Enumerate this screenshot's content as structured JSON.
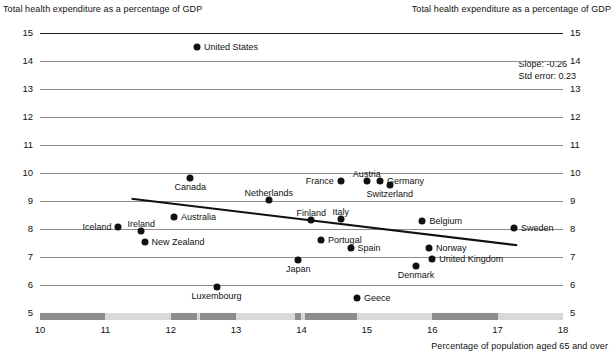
{
  "chart_data": {
    "type": "scatter",
    "title": "",
    "ylabel": "Total health expenditure as a percentage of GDP",
    "ylabel_right": "Total health expenditure as a percentage of GDP",
    "xlabel": "Percentage of population aged 65 and over",
    "xlim": [
      10,
      18
    ],
    "ylim": [
      5,
      15
    ],
    "xticks": [
      10,
      11,
      12,
      13,
      14,
      15,
      16,
      17,
      18
    ],
    "yticks": [
      5,
      6,
      7,
      8,
      9,
      10,
      11,
      12,
      13,
      14,
      15
    ],
    "grid": "horizontal",
    "legend": "none",
    "annotations": {
      "slope": "Slope: -0.26",
      "std_error": "Std error: 0.23"
    },
    "trendline": {
      "slope": -0.26,
      "std_error": 0.23,
      "x_start": 11.4,
      "y_start": 9.08,
      "x_end": 17.3,
      "y_end": 7.42
    },
    "points": [
      {
        "label": "United States",
        "x": 12.4,
        "y": 14.5,
        "label_pos": "right"
      },
      {
        "label": "Canada",
        "x": 12.3,
        "y": 9.82,
        "label_pos": "below"
      },
      {
        "label": "Austria",
        "x": 15.0,
        "y": 9.73,
        "label_pos": "above"
      },
      {
        "label": "Germany",
        "x": 15.2,
        "y": 9.73,
        "label_pos": "right"
      },
      {
        "label": "France",
        "x": 14.6,
        "y": 9.72,
        "label_pos": "left"
      },
      {
        "label": "Switzerland",
        "x": 15.35,
        "y": 9.58,
        "label_pos": "below"
      },
      {
        "label": "Netherlands",
        "x": 13.5,
        "y": 9.02,
        "label_pos": "above"
      },
      {
        "label": "Australia",
        "x": 12.05,
        "y": 8.42,
        "label_pos": "right"
      },
      {
        "label": "Finland",
        "x": 14.15,
        "y": 8.32,
        "label_pos": "above"
      },
      {
        "label": "Italy",
        "x": 14.6,
        "y": 8.35,
        "label_pos": "above"
      },
      {
        "label": "Belgium",
        "x": 15.85,
        "y": 8.28,
        "label_pos": "right"
      },
      {
        "label": "Sweden",
        "x": 17.25,
        "y": 8.05,
        "label_pos": "right"
      },
      {
        "label": "Iceland",
        "x": 11.2,
        "y": 8.08,
        "label_pos": "left"
      },
      {
        "label": "Ireland",
        "x": 11.55,
        "y": 7.92,
        "label_pos": "above"
      },
      {
        "label": "New Zealand",
        "x": 11.6,
        "y": 7.52,
        "label_pos": "right"
      },
      {
        "label": "Portugal",
        "x": 14.3,
        "y": 7.62,
        "label_pos": "right"
      },
      {
        "label": "Spain",
        "x": 14.75,
        "y": 7.32,
        "label_pos": "right"
      },
      {
        "label": "Norway",
        "x": 15.95,
        "y": 7.32,
        "label_pos": "right"
      },
      {
        "label": "Japan",
        "x": 13.95,
        "y": 6.88,
        "label_pos": "below"
      },
      {
        "label": "United Kingdom",
        "x": 16.0,
        "y": 6.92,
        "label_pos": "right"
      },
      {
        "label": "Denmark",
        "x": 15.75,
        "y": 6.68,
        "label_pos": "below"
      },
      {
        "label": "Luxembourg",
        "x": 12.7,
        "y": 5.92,
        "label_pos": "below"
      },
      {
        "label": "Geece",
        "x": 14.85,
        "y": 5.52,
        "label_pos": "right"
      }
    ]
  },
  "axis_bar": {
    "dark_color": "#8c8c8c",
    "light_color": "#d9d9d9",
    "segments": [
      {
        "from": 10.0,
        "to": 11.0
      },
      {
        "from": 12.0,
        "to": 12.4
      },
      {
        "from": 12.45,
        "to": 13.0
      },
      {
        "from": 13.9,
        "to": 14.0
      },
      {
        "from": 14.05,
        "to": 14.85
      },
      {
        "from": 16.0,
        "to": 17.0
      }
    ]
  }
}
